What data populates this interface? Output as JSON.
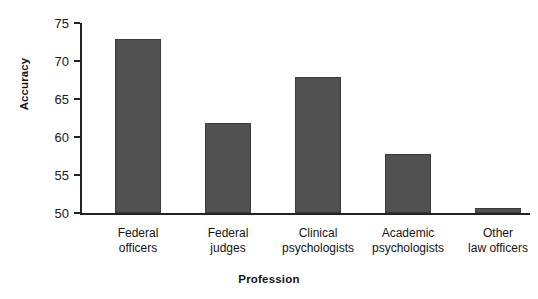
{
  "chart_data": {
    "type": "bar",
    "title": "",
    "xlabel": "Profession",
    "ylabel": "Accuracy",
    "categories": [
      "Federal officers",
      "Federal judges",
      "Clinical psychologists",
      "Academic psychologists",
      "Other law officers"
    ],
    "category_lines": [
      [
        "Federal",
        "officers"
      ],
      [
        "Federal",
        "judges"
      ],
      [
        "Clinical",
        "psychologists"
      ],
      [
        "Academic",
        "psychologists"
      ],
      [
        "Other",
        "law officers"
      ]
    ],
    "values": [
      72.9,
      61.8,
      67.9,
      57.7,
      50.7
    ],
    "ylim": [
      50,
      75
    ],
    "yticks": [
      50,
      55,
      60,
      65,
      70,
      75
    ],
    "ytick_labels": [
      "50",
      "55",
      "60",
      "65",
      "70",
      "75"
    ],
    "grid": false,
    "legend": null,
    "bar_color": "#515151",
    "axis_color": "#222222"
  },
  "axes": {
    "y_title": "Accuracy",
    "x_title": "Profession"
  }
}
